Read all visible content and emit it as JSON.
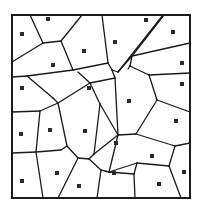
{
  "diagram": {
    "type": "voronoi-tessellation",
    "frame": {
      "x": 12,
      "y": 15,
      "width": 178,
      "height": 183,
      "stroke": "#1a1a1a"
    },
    "line_color": "#1a1a1a",
    "seed_color": "#2a2a2a",
    "seeds": [
      [
        48,
        19
      ],
      [
        22,
        34
      ],
      [
        84,
        51
      ],
      [
        53,
        65
      ],
      [
        22,
        88
      ],
      [
        89,
        88
      ],
      [
        146,
        20
      ],
      [
        173,
        32
      ],
      [
        115,
        42
      ],
      [
        182,
        63
      ],
      [
        182,
        84
      ],
      [
        129,
        101
      ],
      [
        21,
        134
      ],
      [
        50,
        130
      ],
      [
        85,
        131
      ],
      [
        22,
        181
      ],
      [
        57,
        173
      ],
      [
        79,
        186
      ],
      [
        176,
        121
      ],
      [
        116,
        143
      ],
      [
        152,
        156
      ],
      [
        114,
        173
      ],
      [
        184,
        172
      ],
      [
        159,
        184
      ]
    ],
    "edges": [
      "M30,15 L43,43",
      "M43,43 L12,62",
      "M43,43 L61,41",
      "M61,41 L82,15",
      "M61,41 L73,70",
      "M73,70 L27,76",
      "M27,76 L12,77",
      "M27,76 L53,98",
      "M73,70 L108,63",
      "M108,63 L102,15",
      "M108,63 L112,70",
      "M112,70 L118,72",
      "M118,72 L163,15",
      "M118,72 L132,56",
      "M132,56 L164,15",
      "M132,56 L190,43",
      "M132,56 L130,66",
      "M130,66 L128,69",
      "M130,66 L149,75",
      "M149,75 L190,73",
      "M149,75 L157,100",
      "M157,100 L190,112",
      "M112,70 L115,78",
      "M115,78 L90,83",
      "M90,83 L78,72",
      "M115,78 L118,135",
      "M53,98 L58,103",
      "M58,103 L40,111",
      "M40,111 L12,112",
      "M40,111 L36,152",
      "M36,152 L12,153",
      "M36,152 L61,150",
      "M61,150 L67,146",
      "M67,146 L78,158",
      "M78,158 L89,159",
      "M89,159 L94,154",
      "M58,103 L67,146",
      "M58,103 L90,83",
      "M94,154 L100,104",
      "M100,104 L90,83",
      "M100,104 L118,135",
      "M118,135 L94,154",
      "M36,152 L43,198",
      "M78,158 L58,198",
      "M89,159 L101,170",
      "M101,170 L97,198",
      "M101,170 L109,172",
      "M109,172 L118,135",
      "M109,172 L137,163",
      "M118,135 L136,134",
      "M136,134 L157,100",
      "M136,134 L175,146",
      "M175,146 L190,143",
      "M175,146 L169,166",
      "M169,166 L137,163",
      "M137,163 L134,174",
      "M134,174 L109,172",
      "M134,174 L135,198",
      "M169,166 L181,198"
    ],
    "caption": ""
  }
}
